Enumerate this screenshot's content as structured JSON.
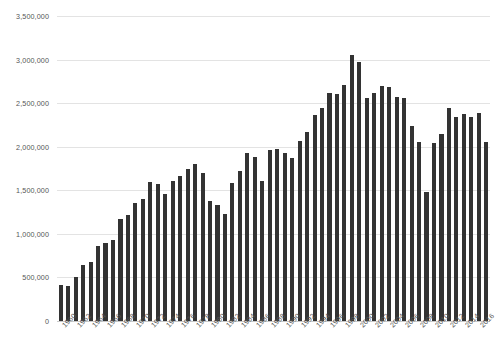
{
  "chart_data": {
    "type": "bar",
    "title": "",
    "subtitle": "",
    "xlabel": "",
    "ylabel": "",
    "ylim": [
      0,
      3500000
    ],
    "y_ticks": [
      0,
      500000,
      1000000,
      1500000,
      2000000,
      2500000,
      3000000,
      3500000
    ],
    "y_tick_labels": [
      "0",
      "500,000",
      "1,000,000",
      "1,500,000",
      "2,000,000",
      "2,500,000",
      "3,000,000",
      "3,500,000"
    ],
    "grid": true,
    "legend": null,
    "bar_color": "#333333",
    "grid_color": "#e3e3e3",
    "axis_color": "#c9c9c9",
    "text_color": "#555555",
    "x_tick_label_step": 2,
    "x_tick_labels": [
      "1960",
      "1962",
      "1964",
      "1966",
      "1968",
      "1970",
      "1972",
      "1974",
      "1976",
      "1978",
      "1980",
      "1982",
      "1984",
      "1986",
      "1988",
      "1990",
      "1992",
      "1994",
      "1996",
      "1998",
      "2000",
      "2002",
      "2004",
      "2006",
      "2008",
      "2010",
      "2012",
      "2014",
      "2016"
    ],
    "categories": [
      "1960",
      "1961",
      "1962",
      "1963",
      "1964",
      "1965",
      "1966",
      "1967",
      "1968",
      "1969",
      "1970",
      "1971",
      "1972",
      "1973",
      "1974",
      "1975",
      "1976",
      "1977",
      "1978",
      "1979",
      "1980",
      "1981",
      "1982",
      "1983",
      "1984",
      "1985",
      "1986",
      "1987",
      "1988",
      "1989",
      "1990",
      "1991",
      "1992",
      "1993",
      "1994",
      "1995",
      "1996",
      "1997",
      "1998",
      "1999",
      "2000",
      "2001",
      "2002",
      "2003",
      "2004",
      "2005",
      "2006",
      "2007",
      "2008",
      "2009",
      "2010",
      "2011",
      "2012",
      "2013",
      "2014",
      "2015",
      "2016",
      "2017"
    ],
    "values": [
      410000,
      400000,
      500000,
      640000,
      680000,
      860000,
      900000,
      930000,
      1170000,
      1220000,
      1350000,
      1400000,
      1600000,
      1570000,
      1460000,
      1610000,
      1660000,
      1740000,
      1800000,
      1700000,
      1380000,
      1330000,
      1230000,
      1580000,
      1720000,
      1930000,
      1880000,
      1610000,
      1960000,
      1970000,
      1930000,
      1870000,
      2070000,
      2170000,
      2360000,
      2450000,
      2620000,
      2600000,
      2710000,
      3050000,
      2970000,
      2560000,
      2620000,
      2700000,
      2690000,
      2570000,
      2560000,
      2240000,
      2060000,
      1480000,
      2040000,
      2150000,
      2440000,
      2340000,
      2380000,
      2340000,
      2390000,
      2060000
    ]
  }
}
